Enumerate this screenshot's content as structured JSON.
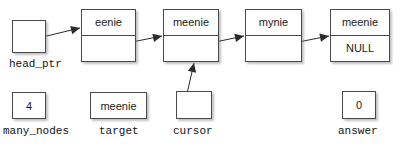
{
  "diagram": {
    "background": "#ffffff",
    "line_color": "#2b2b2b",
    "box_border": "#4a4a4a"
  },
  "nodes": [
    {
      "id": "node1",
      "data": "eenie",
      "link": "",
      "x": 81,
      "y": 9,
      "w": 55,
      "h": 53
    },
    {
      "id": "node2",
      "data": "meenie",
      "link": "",
      "x": 163,
      "y": 9,
      "w": 56,
      "h": 53
    },
    {
      "id": "node3",
      "data": "mynie",
      "link": "",
      "x": 245,
      "y": 9,
      "w": 57,
      "h": 53
    },
    {
      "id": "node4",
      "data": "meenie",
      "link": "NULL",
      "x": 330,
      "y": 9,
      "w": 60,
      "h": 53
    }
  ],
  "variables": [
    {
      "id": "head_ptr",
      "label": "head_ptr",
      "value": "",
      "x": 12,
      "y": 20,
      "w": 34,
      "h": 33,
      "label_x": 9,
      "label_y": 59
    },
    {
      "id": "many_nodes",
      "label": "many_nodes",
      "value": "4",
      "x": 12,
      "y": 92,
      "w": 34,
      "h": 27,
      "label_x": 3,
      "label_y": 126
    },
    {
      "id": "target",
      "label": "target",
      "value": "meenie",
      "x": 90,
      "y": 92,
      "w": 57,
      "h": 27,
      "label_x": 99,
      "label_y": 126
    },
    {
      "id": "cursor",
      "label": "cursor",
      "value": "",
      "x": 176,
      "y": 91,
      "w": 36,
      "h": 28,
      "label_x": 173,
      "label_y": 126
    },
    {
      "id": "answer",
      "label": "answer",
      "value": "0",
      "x": 342,
      "y": 91,
      "w": 34,
      "h": 28,
      "label_x": 338,
      "label_y": 126
    }
  ],
  "arrows": [
    {
      "id": "head-to-node1",
      "from": [
        30,
        40
      ],
      "to": [
        80,
        28
      ]
    },
    {
      "id": "node1-to-node2",
      "from": [
        112,
        46
      ],
      "to": [
        162,
        36
      ]
    },
    {
      "id": "node2-to-node3",
      "from": [
        196,
        46
      ],
      "to": [
        244,
        36
      ]
    },
    {
      "id": "node3-to-node4",
      "from": [
        278,
        46
      ],
      "to": [
        329,
        36
      ]
    },
    {
      "id": "cursor-to-node2",
      "from": [
        186,
        98
      ],
      "to": [
        194,
        63
      ]
    }
  ]
}
